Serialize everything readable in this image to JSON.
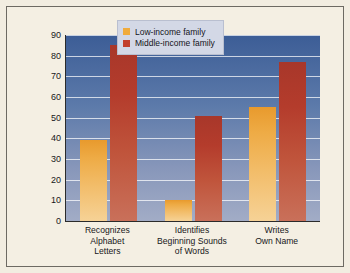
{
  "chart_data": {
    "type": "bar",
    "title": "",
    "xlabel": "",
    "ylabel": "Percentage of Kindergartners",
    "ylim": [
      0,
      90
    ],
    "ytick_step": 10,
    "yticks": [
      "0",
      "10",
      "20",
      "30",
      "40",
      "50",
      "60",
      "70",
      "80",
      "90"
    ],
    "grid": true,
    "legend_position": "top-center",
    "categories": [
      "Recognizes Alphabet Letters",
      "Identifies Beginning Sounds of Words",
      "Writes Own Name"
    ],
    "category_lines": [
      [
        "Recognizes",
        "Alphabet",
        "Letters"
      ],
      [
        "Identifies",
        "Beginning Sounds",
        "of Words"
      ],
      [
        "Writes",
        "Own Name"
      ]
    ],
    "series": [
      {
        "name": "Low-income family",
        "color": "#f0ab3c",
        "values": [
          39,
          10,
          55
        ]
      },
      {
        "name": "Middle-income family",
        "color": "#c2402c",
        "values": [
          85,
          51,
          77
        ]
      }
    ]
  },
  "colors": {
    "page_background": "#f2ede1",
    "plot_background_top": "#3c5d96",
    "plot_background_bottom": "#a2acc6",
    "gridline": "#ffffff",
    "axis": "#2b2b2b",
    "legend_background": "#d3d8e6",
    "text": "#17171a"
  }
}
